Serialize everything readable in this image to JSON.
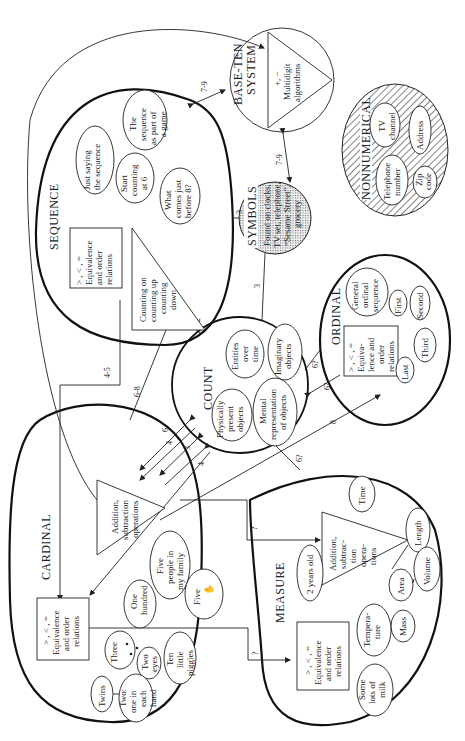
{
  "diagram": {
    "orientation": "rotated-90-ccw",
    "regions": {
      "sequence": {
        "title": "SEQUENCE",
        "box": [
          "> , < , =",
          "Equivalence",
          "and order",
          "relations"
        ],
        "triangle": [
          "Counting on",
          "counting up",
          "counting",
          "down"
        ],
        "items": [
          [
            "Just saying",
            "the sequence"
          ],
          [
            "Start",
            "counting",
            "at 6"
          ],
          [
            "The",
            "sequence",
            "as part of",
            "a game"
          ],
          [
            "What",
            "comes just",
            "before 8?"
          ]
        ]
      },
      "base_ten": {
        "title": [
          "BASE-TEN",
          "SYSTEM"
        ],
        "triangle": [
          "+, −",
          "Multidigit",
          "algorithms"
        ]
      },
      "symbols": {
        "title": "SYMBOLS",
        "lines": [
          "Found on clocks,",
          "TV set, telephone,",
          "“Sesame Street”,",
          "grocery"
        ]
      },
      "nonnumerical": {
        "title": "NONNUMERICAL",
        "items": [
          [
            "TV",
            "channel"
          ],
          [
            "Address"
          ],
          [
            "Telephone",
            "number"
          ],
          [
            "Zip",
            "code"
          ]
        ]
      },
      "count": {
        "title": "COUNT",
        "items": [
          [
            "Entities",
            "over",
            "time"
          ],
          [
            "Imaginary",
            "objects"
          ],
          [
            "Physically",
            "present",
            "objects"
          ],
          [
            "Mental",
            "representation",
            "of objects"
          ]
        ]
      },
      "ordinal": {
        "title": "ORDINAL",
        "box": [
          "> , < , =",
          "Equiva-",
          "lence and",
          "order",
          "relations"
        ],
        "items": [
          [
            "General",
            "ordinal",
            "sequence"
          ],
          [
            "First"
          ],
          [
            "Second"
          ],
          [
            "Third"
          ],
          [
            "Last"
          ]
        ]
      },
      "cardinal": {
        "title": "CARDINAL",
        "triangle": [
          "Addition,",
          "subtraction",
          "operations"
        ],
        "box": [
          "> , < , =",
          "Equivalence",
          "and order",
          "relations"
        ],
        "items": [
          [
            "One",
            "hundred"
          ],
          [
            "Five",
            "people in",
            "my family"
          ],
          [
            "Five"
          ],
          [
            "Three"
          ],
          [
            "Two",
            "eyes"
          ],
          [
            "Ten",
            "little",
            "piggies"
          ],
          [
            "Twins"
          ],
          [
            "Two:",
            "one in",
            "each",
            "hand"
          ]
        ]
      },
      "measure": {
        "title": "MEASURE",
        "triangle": [
          "Addition,",
          "subtrac-",
          "tion",
          "opera-",
          "tions"
        ],
        "box": [
          "> , < , =",
          "Equivalence",
          "and order",
          "relations"
        ],
        "items": [
          [
            "2 years old"
          ],
          [
            "Time"
          ],
          [
            "Length"
          ],
          [
            "Volume"
          ],
          [
            "Area"
          ],
          [
            "Mass"
          ],
          [
            "Tempera-",
            "ture"
          ],
          [
            "Some",
            "lots of",
            "milk"
          ]
        ]
      }
    },
    "age_labels": {
      "seq_base": "7-9",
      "symbols_base": "7-9",
      "seq_symbols": "3",
      "count_symbols": "3",
      "seq_count": "2",
      "seq_cardinal": "4-5",
      "count_seq_tri": "6-8",
      "count_card_6": "6",
      "count_card_4a": "4",
      "count_card_3": "3",
      "count_card_4b": "4",
      "count_ordinal_a": "6?",
      "count_ordinal_b": "6?",
      "cardinal_ordinal": "8",
      "count_measure": "6?",
      "card_measure_a": "?",
      "card_measure_b": "?"
    }
  }
}
